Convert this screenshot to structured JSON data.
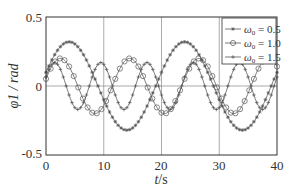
{
  "chart_data": {
    "type": "line",
    "title": "",
    "xlabel": "t/s",
    "ylabel": "φ1 / rad",
    "xlim": [
      0,
      40
    ],
    "ylim": [
      -0.5,
      0.5
    ],
    "xticks": [
      "0",
      "10",
      "20",
      "30",
      "40"
    ],
    "yticks": [
      "-0.5",
      "0",
      "0.5"
    ],
    "grid": {
      "vertical_at": [
        10,
        20,
        30
      ],
      "horizontal_at": [
        0
      ]
    },
    "legend_position": "upper right",
    "series": [
      {
        "name": "ω0 = 0.5",
        "marker": "asterisk",
        "amplitude": 0.32,
        "period": 20,
        "phase_peak_t": 4,
        "offset": 0,
        "x": [
          0,
          2,
          4,
          6,
          8,
          10,
          12,
          14,
          16,
          18,
          20,
          22,
          24,
          26,
          28,
          30,
          32,
          34,
          36,
          38,
          40
        ],
        "values": [
          0.1,
          0.27,
          0.32,
          0.26,
          0.1,
          -0.1,
          -0.26,
          -0.31,
          -0.26,
          -0.1,
          0.1,
          0.26,
          0.32,
          0.26,
          0.1,
          -0.1,
          -0.26,
          -0.31,
          -0.26,
          -0.1,
          0.1
        ]
      },
      {
        "name": "ω0 = 1.0",
        "marker": "circle",
        "amplitude": 0.2,
        "period": 12,
        "phase_peak_t": 2.5,
        "x": [
          0,
          2,
          4,
          6,
          8,
          10,
          12,
          14,
          16,
          18,
          20,
          22,
          24,
          26,
          28,
          30,
          32,
          34,
          36,
          38,
          40
        ],
        "values": [
          0.1,
          0.19,
          0.15,
          -0.02,
          -0.17,
          -0.19,
          -0.05,
          0.15,
          0.2,
          0.08,
          -0.12,
          -0.2,
          -0.1,
          0.1,
          0.2,
          0.12,
          -0.08,
          -0.19,
          -0.14,
          0.02,
          0.17
        ]
      },
      {
        "name": "ω0 = 1.5",
        "marker": "plus",
        "amplitude": 0.17,
        "period": 8,
        "phase_peak_t": 1.5,
        "x": [
          0,
          2,
          4,
          6,
          8,
          10,
          12,
          14,
          16,
          18,
          20,
          22,
          24,
          26,
          28,
          30,
          32,
          34,
          36,
          38,
          40
        ],
        "values": [
          0.12,
          0.16,
          -0.05,
          -0.16,
          0.05,
          0.16,
          -0.04,
          -0.16,
          0.06,
          0.15,
          -0.06,
          -0.15,
          0.06,
          0.15,
          -0.05,
          -0.16,
          0.04,
          0.16,
          -0.05,
          -0.16,
          0.1
        ]
      }
    ]
  },
  "axes": {
    "x_label_italic": "t",
    "x_label_rest": "/s",
    "y_label": "φ1 / rad",
    "y_tick_top": "0.5",
    "y_tick_mid": "0",
    "y_tick_bottom": "-0.5",
    "x_ticks": [
      "0",
      "10",
      "20",
      "30",
      "40"
    ]
  },
  "legend": {
    "items": [
      {
        "symbol": "ω",
        "sub": "0",
        "text": " = 0.5"
      },
      {
        "symbol": "ω",
        "sub": "0",
        "text": " = 1.0"
      },
      {
        "symbol": "ω",
        "sub": "0",
        "text": " = 1.5"
      }
    ]
  },
  "colors": {
    "line": "#555555",
    "axis": "#333333",
    "grid": "#888888"
  }
}
